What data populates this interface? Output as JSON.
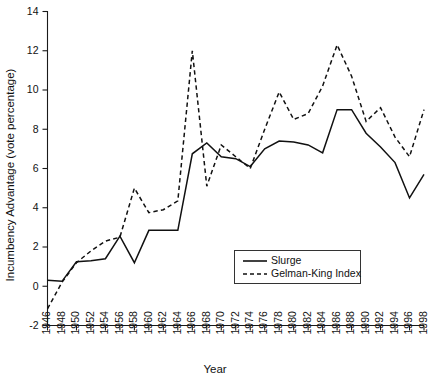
{
  "chart_data": {
    "type": "line",
    "title": "",
    "xlabel": "Year",
    "ylabel": "Incumbency Advantage (vote percentage)",
    "xlim": [
      1946,
      1998
    ],
    "ylim": [
      -2,
      14
    ],
    "ytick_step": 2,
    "xtick_step": 2,
    "grid": false,
    "legend_position": "inside-bottom-right",
    "yticks": [
      "-2",
      "0",
      "2",
      "4",
      "6",
      "8",
      "10",
      "12",
      "14"
    ],
    "xticks": [
      "1946",
      "1948",
      "1950",
      "1952",
      "1954",
      "1956",
      "1958",
      "1960",
      "1962",
      "1964",
      "1966",
      "1968",
      "1970",
      "1972",
      "1974",
      "1976",
      "1978",
      "1980",
      "1982",
      "1984",
      "1986",
      "1988",
      "1990",
      "1992",
      "1994",
      "1996",
      "1998"
    ],
    "x": [
      1946,
      1948,
      1950,
      1952,
      1954,
      1956,
      1958,
      1960,
      1962,
      1964,
      1966,
      1968,
      1970,
      1972,
      1974,
      1976,
      1978,
      1980,
      1982,
      1984,
      1986,
      1988,
      1990,
      1992,
      1994,
      1996,
      1998
    ],
    "series": [
      {
        "name": "Slurge",
        "style": "solid",
        "values": [
          0.3,
          0.25,
          1.25,
          1.3,
          1.4,
          2.55,
          1.2,
          2.85,
          2.85,
          2.85,
          6.75,
          7.3,
          6.6,
          6.5,
          6.1,
          7.0,
          7.4,
          7.35,
          7.2,
          6.8,
          9.0,
          9.0,
          7.8,
          7.1,
          6.3,
          4.5,
          5.7
        ]
      },
      {
        "name": "Gelman-King Index",
        "style": "dashed",
        "values": [
          -1.15,
          0.2,
          1.2,
          1.8,
          2.3,
          2.5,
          5.0,
          3.75,
          3.9,
          4.35,
          12.0,
          5.1,
          7.2,
          6.6,
          6.0,
          8.0,
          9.9,
          8.5,
          8.8,
          10.2,
          12.3,
          10.7,
          8.4,
          9.1,
          7.6,
          6.6,
          9.0
        ]
      }
    ]
  },
  "legend": {
    "items": [
      {
        "label": "Slurge",
        "style": "solid"
      },
      {
        "label": "Gelman-King Index",
        "style": "dashed"
      }
    ]
  },
  "axis": {
    "x_title": "Year",
    "y_title": "Incumbency Advantage (vote percentage)"
  }
}
